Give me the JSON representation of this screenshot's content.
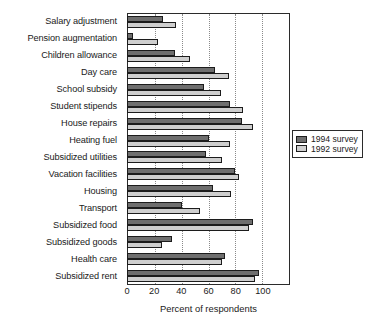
{
  "chart_data": {
    "type": "bar",
    "orientation": "horizontal",
    "title": "",
    "xlabel": "Percent of respondents",
    "ylabel": "",
    "xlim": [
      0,
      120
    ],
    "xticks": [
      0,
      20,
      40,
      60,
      80,
      100
    ],
    "grid": "vertical-dotted",
    "legend_position": "right",
    "categories": [
      "Salary adjustment",
      "Pension augmentation",
      "Children allowance",
      "Day care",
      "School subsidy",
      "Student stipends",
      "House repairs",
      "Heating fuel",
      "Subsidized utilities",
      "Vacation facilities",
      "Housing",
      "Transport",
      "Subsidized food",
      "Subsidized goods",
      "Health care",
      "Subsidized rent"
    ],
    "series": [
      {
        "name": "1994 survey",
        "color": "#6e6e6e",
        "values": [
          26,
          4,
          35,
          65,
          57,
          76,
          85,
          60,
          58,
          80,
          63,
          40,
          93,
          33,
          72,
          98
        ]
      },
      {
        "name": "1992 survey",
        "color": "#cfcfcf",
        "values": [
          36,
          22,
          46,
          75,
          69,
          86,
          93,
          76,
          70,
          83,
          77,
          54,
          90,
          25,
          70,
          95
        ]
      }
    ]
  },
  "legend": {
    "entries": [
      {
        "label": "1994 survey"
      },
      {
        "label": "1992 survey"
      }
    ]
  },
  "axis": {
    "x_title": "Percent of respondents",
    "tick_labels": [
      "0",
      "20",
      "40",
      "60",
      "80",
      "100"
    ]
  }
}
